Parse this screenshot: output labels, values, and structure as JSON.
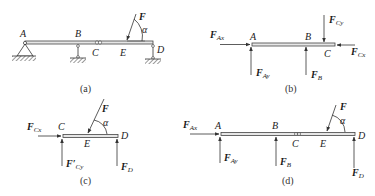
{
  "panels": [
    {
      "id": "a",
      "caption": "(a)",
      "points": {
        "A": "A",
        "B": "B",
        "C": "C",
        "D": "D",
        "E": "E"
      },
      "force": {
        "name": "F",
        "angle": "α"
      },
      "description": "Compound beam ABCD with pin support at A, roller supports at B and D, hinge at C, inclined force F at E"
    },
    {
      "id": "b",
      "caption": "(b)",
      "points": {
        "A": "A",
        "B": "B",
        "C": "C"
      },
      "forces": [
        {
          "base": "F",
          "sub": "Ax"
        },
        {
          "base": "F",
          "sub": "Ay"
        },
        {
          "base": "F",
          "sub": "B"
        },
        {
          "base": "F",
          "sub": "Cy"
        },
        {
          "base": "F",
          "sub": "Cx"
        }
      ]
    },
    {
      "id": "c",
      "caption": "(c)",
      "points": {
        "C": "C",
        "D": "D",
        "E": "E"
      },
      "force": {
        "name": "F",
        "angle": "α"
      },
      "forces": [
        {
          "base": "F",
          "sub": "Cx"
        },
        {
          "base": "F′",
          "sub": "Cy"
        },
        {
          "base": "F",
          "sub": "D"
        }
      ]
    },
    {
      "id": "d",
      "caption": "(d)",
      "points": {
        "A": "A",
        "B": "B",
        "C": "C",
        "D": "D",
        "E": "E"
      },
      "force": {
        "name": "F",
        "angle": "α"
      },
      "forces": [
        {
          "base": "F",
          "sub": "Ax"
        },
        {
          "base": "F",
          "sub": "Ay"
        },
        {
          "base": "F",
          "sub": "B"
        },
        {
          "base": "F",
          "sub": "D"
        }
      ]
    }
  ]
}
